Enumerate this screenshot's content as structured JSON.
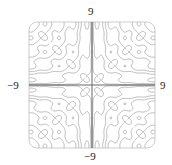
{
  "chart_data": {
    "type": "contour",
    "title": "",
    "xlabel": "",
    "ylabel": "",
    "xlim": [
      -9,
      9
    ],
    "ylim": [
      -9,
      9
    ],
    "tick_labels": {
      "top": "9",
      "bottom": "−9",
      "left": "−9",
      "right": "9"
    },
    "function": {
      "amplitude": 0.55,
      "frequency_pi_multiple": 1
    },
    "levels": [
      -64,
      -49,
      -36,
      -25,
      -16,
      -9,
      -4,
      -1,
      1,
      4,
      9,
      16,
      25,
      36,
      49,
      64
    ],
    "grid": false,
    "axes_lines": true
  },
  "style": {
    "axis_color": "#666666",
    "contour_color": "#aaaaaa",
    "frame_color": "#cccccc"
  }
}
